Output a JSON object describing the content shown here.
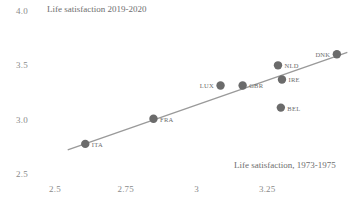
{
  "chart_data": {
    "type": "scatter",
    "title": "Life satisfaction 2019-2020",
    "xlabel": "Life satisfaction, 1973-1975",
    "ylabel": "Life satisfaction 2019-2020",
    "xlim": [
      2.42,
      3.57
    ],
    "ylim": [
      2.5,
      4.0
    ],
    "grid": false,
    "legend": "none",
    "xticks": [
      "2.5",
      "2.75",
      "3",
      "3.25"
    ],
    "xtick_values": [
      2.5,
      2.75,
      3,
      3.25
    ],
    "yticks": [
      "2.5",
      "3.0",
      "3.5",
      "4.0"
    ],
    "ytick_values": [
      2.5,
      3.0,
      3.5,
      4.0
    ],
    "point_color": "#6b6b6b",
    "line_color": "#9a9a9a",
    "text_color": "#8a8a8a",
    "points": [
      {
        "label": "ITA",
        "x": 2.607,
        "y": 2.777,
        "label_side": "right"
      },
      {
        "label": "FRA",
        "x": 2.848,
        "y": 3.009,
        "label_side": "right"
      },
      {
        "label": "LUX",
        "x": 3.085,
        "y": 3.315,
        "label_side": "left"
      },
      {
        "label": "GBR",
        "x": 3.163,
        "y": 3.315,
        "label_side": "right"
      },
      {
        "label": "NLD",
        "x": 3.288,
        "y": 3.5,
        "label_side": "right"
      },
      {
        "label": "IRE",
        "x": 3.302,
        "y": 3.37,
        "label_side": "right"
      },
      {
        "label": "BEL",
        "x": 3.298,
        "y": 3.111,
        "label_side": "right"
      },
      {
        "label": "DNK",
        "x": 3.496,
        "y": 3.602,
        "label_side": "left"
      }
    ],
    "trendline": {
      "x0": 2.545,
      "y0": 2.722,
      "x1": 3.533,
      "y1": 3.62
    }
  }
}
